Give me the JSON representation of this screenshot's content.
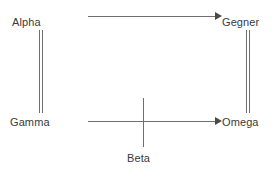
{
  "diagram": {
    "type": "commutative-square",
    "background_color": "#ffffff",
    "stroke_color": "#6e6e6e",
    "text_color": "#3a3a3a",
    "nodes": [
      {
        "id": "alpha",
        "label": "Alpha",
        "position": "top-left"
      },
      {
        "id": "gegner",
        "label": "Gegner",
        "position": "top-right"
      },
      {
        "id": "gamma",
        "label": "Gamma",
        "position": "bottom-left"
      },
      {
        "id": "omega",
        "label": "Omega",
        "position": "bottom-right"
      },
      {
        "id": "beta",
        "label": "Beta",
        "position": "bottom-center"
      }
    ],
    "edges": [
      {
        "id": "alpha-to-gegner",
        "from": "Alpha",
        "to": "Gegner",
        "style": "arrow",
        "orientation": "horizontal"
      },
      {
        "id": "gamma-to-omega",
        "from": "Gamma",
        "to": "Omega",
        "style": "arrow",
        "orientation": "horizontal"
      },
      {
        "id": "alpha-gamma",
        "from": "Alpha",
        "to": "Gamma",
        "style": "double-line",
        "orientation": "vertical"
      },
      {
        "id": "gegner-omega",
        "from": "Gegner",
        "to": "Omega",
        "style": "double-line",
        "orientation": "vertical"
      },
      {
        "id": "beta-vertical",
        "from": "Beta",
        "to": "",
        "style": "line",
        "orientation": "vertical"
      }
    ]
  }
}
